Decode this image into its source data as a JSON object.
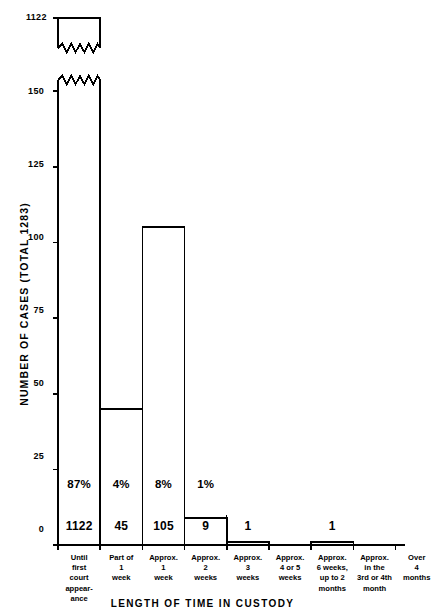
{
  "chart_data": {
    "type": "bar",
    "title": "",
    "subtitle": "",
    "xlabel": "LENGTH OF TIME IN CUSTODY",
    "ylabel": "NUMBER OF CASES   (TOTAL 1283)",
    "ylim": [
      0,
      150
    ],
    "yticks": [
      0,
      25,
      50,
      75,
      100,
      125,
      150
    ],
    "ytick_labels": [
      "0",
      "25",
      "50",
      "75",
      "100",
      "125",
      "150"
    ],
    "grid": false,
    "legend": null,
    "axis_break": {
      "present": true,
      "label": "1122",
      "note": "first bar is truncated with a zigzag break; its true height is 1122"
    },
    "categories": [
      "Until\nfirst\ncourt\nappear-\nance",
      "Part of\n1\nweek",
      "Approx.\n1\nweek",
      "Approx.\n2\nweeks",
      "Approx.\n3\nweeks",
      "Approx.\n4 or 5\nweeks",
      "Approx.\n6 weeks,\nup to 2\nmonths",
      "Approx.\nin the\n3rd or 4th\nmonth",
      "Over\n4\nmonths"
    ],
    "values": [
      1122,
      45,
      105,
      9,
      1,
      0,
      1,
      0,
      0
    ],
    "value_labels": [
      "1122",
      "45",
      "105",
      "9",
      "1",
      "",
      "1",
      "",
      ""
    ],
    "percent_labels": [
      "87%",
      "4%",
      "8%",
      "1%",
      "",
      "",
      "",
      "",
      ""
    ],
    "total": 1283
  },
  "colors": {
    "ink": "#000000",
    "background": "#ffffff"
  }
}
